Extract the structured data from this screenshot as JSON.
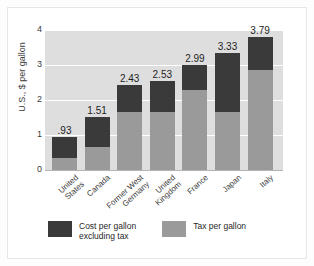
{
  "chart_data": {
    "type": "bar",
    "subtype": "stacked-vertical",
    "title": "",
    "xlabel": "",
    "ylabel": "U.S., $ per gallon",
    "ylim": [
      0,
      4
    ],
    "yticks": [
      "0",
      "1",
      "2",
      "3",
      "4"
    ],
    "grid": true,
    "legend_position": "bottom-left",
    "categories": [
      "United States",
      "Canada",
      "Former West Germany",
      "United Kingdom",
      "France",
      "Japan",
      "Italy"
    ],
    "category_lines": [
      [
        "United",
        "States"
      ],
      [
        "Canada"
      ],
      [
        "Former West",
        "Germany"
      ],
      [
        "United",
        "Kingdom"
      ],
      [
        "France"
      ],
      [
        "Japan"
      ],
      [
        "Italy"
      ]
    ],
    "series": [
      {
        "name": "Tax per gallon",
        "color": "#9a9a9a",
        "values": [
          0.34,
          0.65,
          1.66,
          1.66,
          2.3,
          1.66,
          2.85
        ]
      },
      {
        "name": "Cost per gallon excluding tax",
        "color": "#3a3a3a",
        "values": [
          0.59,
          0.86,
          0.77,
          0.87,
          0.69,
          1.67,
          0.94
        ]
      }
    ],
    "totals": [
      0.93,
      1.51,
      2.43,
      2.53,
      2.99,
      3.33,
      3.79
    ],
    "data_labels": [
      ".93",
      "1.51",
      "2.43",
      "2.53",
      "2.99",
      "3.33",
      "3.79"
    ]
  },
  "legend": {
    "entries": [
      {
        "label": "Cost per gallon\nexcluding tax",
        "color": "#3a3a3a"
      },
      {
        "label": "Tax per gallon",
        "color": "#9a9a9a"
      }
    ]
  },
  "colors": {
    "cost": "#3a3a3a",
    "tax": "#9a9a9a",
    "plot_background": "#dedede",
    "gridline": "#ffffff",
    "figure_background": "#fdfdfd"
  }
}
